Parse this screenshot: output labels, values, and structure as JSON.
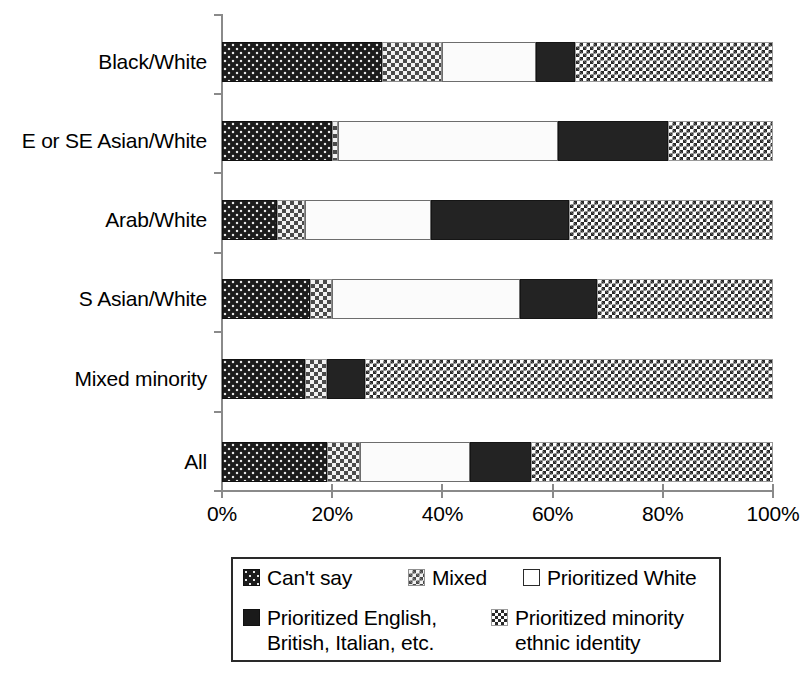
{
  "chart_data": {
    "type": "bar",
    "orientation": "horizontal",
    "stacked": true,
    "normalized": true,
    "title": "",
    "xlabel": "",
    "ylabel": "",
    "xlim": [
      0,
      100
    ],
    "grid": false,
    "legend_position": "bottom",
    "x_tick_labels": [
      "0%",
      "20%",
      "40%",
      "60%",
      "80%",
      "100%"
    ],
    "x_tick_values": [
      0,
      20,
      40,
      60,
      80,
      100
    ],
    "categories": [
      "Black/White",
      "E or SE Asian/White",
      "Arab/White",
      "S Asian/White",
      "Mixed minority",
      "All"
    ],
    "series": [
      {
        "name": "Can't say",
        "pattern": "dark-dotted",
        "values": [
          29,
          20,
          10,
          16,
          15,
          19
        ]
      },
      {
        "name": "Mixed",
        "pattern": "gray-hatched",
        "values": [
          11,
          1,
          5,
          4,
          4,
          6
        ]
      },
      {
        "name": "Prioritized White",
        "pattern": "solid-white",
        "values": [
          17,
          40,
          23,
          34,
          0,
          20
        ]
      },
      {
        "name": "Prioritized English, British, Italian, etc.",
        "pattern": "solid-black",
        "values": [
          7,
          20,
          25,
          14,
          7,
          11
        ]
      },
      {
        "name": "Prioritized minority ethnic identity",
        "pattern": "light-checkered",
        "values": [
          36,
          19,
          37,
          32,
          74,
          44
        ]
      }
    ]
  },
  "legend": {
    "entries": [
      {
        "label": "Can't say",
        "swatch": "cantsay-swatch"
      },
      {
        "label": "Mixed",
        "swatch": "mixed-swatch"
      },
      {
        "label": "Prioritized White",
        "swatch": "white-swatch"
      },
      {
        "label": "Prioritized English,\nBritish, Italian, etc.",
        "swatch": "black-swatch"
      },
      {
        "label": "Prioritized minority\nethnic identity",
        "swatch": "minority-swatch"
      }
    ]
  }
}
